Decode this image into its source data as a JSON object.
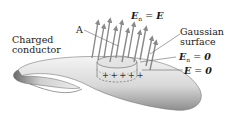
{
  "figure": {
    "labels": {
      "conductor": [
        "Charged",
        "conductor"
      ],
      "point_a": "A",
      "gaussian": [
        "Gaussian",
        "surface"
      ],
      "en_eq_e": {
        "lhs": "E",
        "sub": "n",
        "eq": "=",
        "rhs": "E"
      },
      "en_zero": {
        "lhs": "E",
        "sub": "n",
        "eq": "=",
        "rhs": "0"
      },
      "e_zero": {
        "lhs": "E",
        "eq": "=",
        "rhs": "0"
      }
    },
    "cylinder_charges": [
      "+",
      "+",
      "+",
      "+",
      "+"
    ],
    "colors": {
      "conductor_light": "#f2f2f2",
      "conductor_dark": "#6e6e6e",
      "arrow": "#8a8a8a",
      "text": "#1a1a1a"
    }
  }
}
